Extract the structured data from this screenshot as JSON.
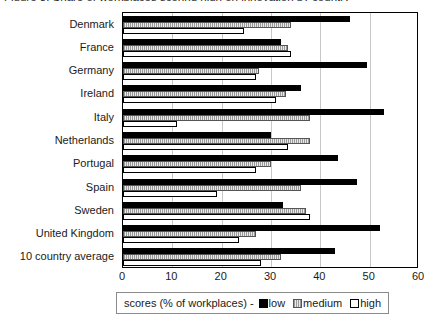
{
  "chart_data": {
    "type": "bar",
    "orientation": "horizontal",
    "title": "Figure 3: Share of workplaces scoring high on innovation by country",
    "xlabel": "",
    "ylabel": "",
    "xlim": [
      0,
      60
    ],
    "xticks": [
      0,
      10,
      20,
      30,
      40,
      50,
      60
    ],
    "xtick_labels": [
      "0",
      "10",
      "20",
      "30",
      "40",
      "50",
      "60"
    ],
    "grid": true,
    "grid_axis": "x",
    "legend_position": "bottom",
    "legend_title": "scores (% of workplaces) -",
    "categories": [
      "Denmark",
      "France",
      "Germany",
      "Ireland",
      "Italy",
      "Netherlands",
      "Portugal",
      "Spain",
      "Sweden",
      "United Kingdom",
      "10 country average"
    ],
    "series": [
      {
        "name": "low",
        "color": "#000000",
        "values": [
          46,
          32,
          49.5,
          36,
          53,
          30,
          43.5,
          47.5,
          32.5,
          52,
          43
        ]
      },
      {
        "name": "medium",
        "color": "#c8c8c8",
        "values": [
          34,
          33.5,
          27.5,
          33,
          38,
          38,
          30,
          36,
          37,
          27,
          32
        ]
      },
      {
        "name": "high",
        "color": "#ffffff",
        "values": [
          24.5,
          34,
          27,
          31,
          11,
          33.5,
          27,
          19,
          38,
          23.5,
          28
        ]
      }
    ]
  },
  "legend": {
    "title": "scores (% of workplaces) -",
    "entries": [
      {
        "label": "low"
      },
      {
        "label": "medium"
      },
      {
        "label": "high"
      }
    ]
  },
  "colors": {
    "low": "#000000",
    "medium": "#c8c8c8",
    "high": "#ffffff",
    "axis": "#000000",
    "gridline": "#c8c8c8"
  }
}
